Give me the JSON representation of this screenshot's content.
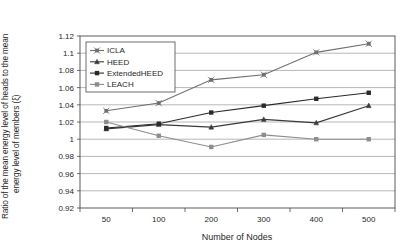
{
  "chart_data": {
    "type": "line",
    "title": "",
    "xlabel": "Number of Nodes",
    "ylabel": "Ratio of the mean energy level of heads to the mean energy level of members (ξ)",
    "ylabel_line1": "Ratio of the mean energy level of heads to the mean",
    "ylabel_line2": "energy level of members (ξ)",
    "categories": [
      "50",
      "100",
      "200",
      "300",
      "400",
      "500"
    ],
    "x": [
      50,
      100,
      200,
      300,
      400,
      500
    ],
    "ylim": [
      0.92,
      1.12
    ],
    "ytick_step": 0.02,
    "yticks": [
      "0.92",
      "0.94",
      "0.96",
      "0.98",
      "1",
      "1.02",
      "1.04",
      "1.06",
      "1.08",
      "1.1",
      "1.12"
    ],
    "ytick_values": [
      0.92,
      0.94,
      0.96,
      0.98,
      1.0,
      1.02,
      1.04,
      1.06,
      1.08,
      1.1,
      1.12
    ],
    "grid": true,
    "legend_position": "top-left",
    "series": [
      {
        "name": "ICLA",
        "marker": "x-square",
        "color": "#6f6f6f",
        "values": [
          1.033,
          1.042,
          1.069,
          1.075,
          1.101,
          1.111
        ]
      },
      {
        "name": "HEED",
        "marker": "triangle",
        "color": "#3a3a3a",
        "values": [
          1.012,
          1.017,
          1.014,
          1.023,
          1.019,
          1.039
        ]
      },
      {
        "name": "ExtendedHEED",
        "marker": "square",
        "color": "#2a2a2a",
        "values": [
          1.013,
          1.018,
          1.031,
          1.039,
          1.047,
          1.054
        ]
      },
      {
        "name": "LEACH",
        "marker": "square",
        "color": "#8d8d8d",
        "values": [
          1.02,
          1.004,
          0.991,
          1.005,
          1.0,
          1.0
        ]
      }
    ]
  },
  "legend": {
    "items": [
      {
        "label": "ICLA"
      },
      {
        "label": "HEED"
      },
      {
        "label": "ExtendedHEED"
      },
      {
        "label": "LEACH"
      }
    ]
  },
  "colors": {
    "grid": "#9a9a9a",
    "frame": "#4a4a4a",
    "background": "#ffffff",
    "text": "#1f1f1f"
  }
}
